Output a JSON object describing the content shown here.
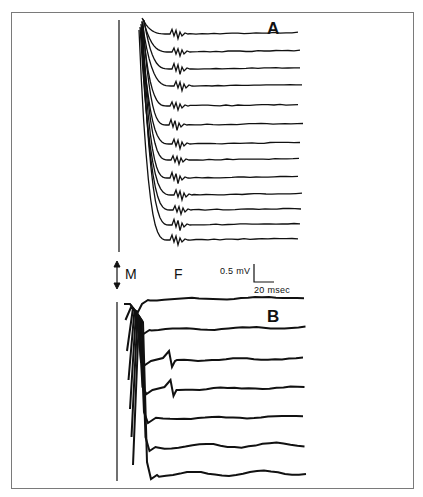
{
  "figure": {
    "panel_a_label": "A",
    "panel_b_label": "B",
    "m_label": "M",
    "f_label": "F",
    "scale_bar": {
      "amplitude_label": "0.5 mV",
      "time_label": "20 msec"
    },
    "icons": {
      "m_arrow": "double-headed vertical arrow"
    },
    "colors": {
      "trace": "#111111",
      "frame": "#7a7a7a",
      "background": "#ffffff"
    }
  },
  "panel_a": {
    "trace_count": 13,
    "baselines_y": [
      34,
      52,
      69,
      86,
      106,
      125,
      144,
      160,
      178,
      195,
      210,
      225,
      240
    ],
    "f_wave_x": [
      176,
      178,
      178,
      180,
      176,
      175,
      178,
      177,
      176,
      180,
      179,
      178,
      176
    ]
  },
  "panel_b": {
    "trace_count": 7,
    "baselines_y": [
      300,
      330,
      361,
      390,
      419,
      447,
      475
    ]
  }
}
